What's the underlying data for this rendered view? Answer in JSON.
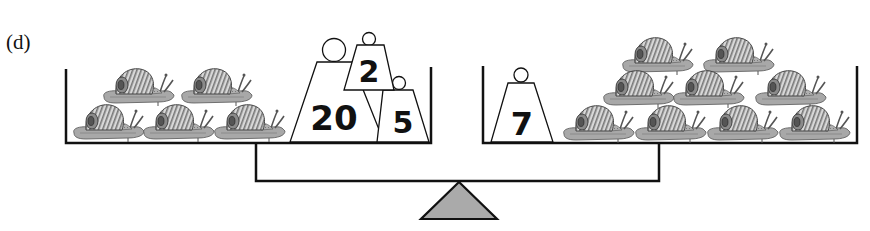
{
  "figure": {
    "panel_label": "(d)"
  },
  "left_pan": {
    "snail_count": 5,
    "weights": [
      {
        "label": "20",
        "value": 20
      },
      {
        "label": "2",
        "value": 2
      },
      {
        "label": "5",
        "value": 5
      }
    ]
  },
  "right_pan": {
    "snail_count": 9,
    "weights": [
      {
        "label": "7",
        "value": 7
      }
    ]
  },
  "colors": {
    "line": "#111111",
    "fulcrum_fill": "#aaaaaa",
    "snail_body": "#9a9a9a",
    "snail_shell": "#b5b5b5"
  }
}
